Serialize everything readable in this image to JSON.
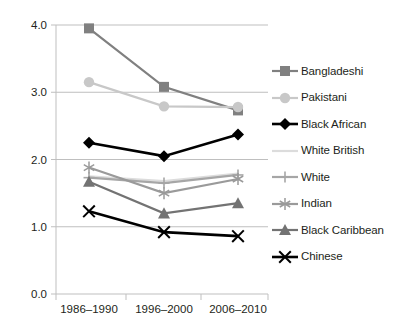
{
  "chart_data": {
    "type": "line",
    "title": "",
    "subtitle": "",
    "xlabel": "",
    "ylabel": "",
    "categories": [
      "1986–1990",
      "1996–2000",
      "2006–2010"
    ],
    "ylim": [
      0.0,
      4.0
    ],
    "ytick_labels": [
      "0.0",
      "1.0",
      "2.0",
      "3.0",
      "4.0"
    ],
    "ytick_values": [
      0.0,
      1.0,
      2.0,
      3.0,
      4.0
    ],
    "grid": true,
    "legend_position": "right",
    "series": [
      {
        "name": "Bangladeshi",
        "values": [
          3.95,
          3.08,
          2.73
        ],
        "color": "#808080",
        "marker": "square"
      },
      {
        "name": "Pakistani",
        "values": [
          3.15,
          2.79,
          2.78
        ],
        "color": "#c8c8c8",
        "marker": "circle"
      },
      {
        "name": "Black African",
        "values": [
          2.25,
          2.05,
          2.37
        ],
        "color": "#000000",
        "marker": "diamond"
      },
      {
        "name": "White British",
        "values": [
          1.75,
          1.68,
          1.79
        ],
        "color": "#dcdcdc",
        "marker": "none"
      },
      {
        "name": "White",
        "values": [
          1.73,
          1.65,
          1.77
        ],
        "color": "#a6a6a6",
        "marker": "plus"
      },
      {
        "name": "Indian",
        "values": [
          1.88,
          1.5,
          1.71
        ],
        "color": "#9a9a9a",
        "marker": "asterisk"
      },
      {
        "name": "Black Caribbean",
        "values": [
          1.67,
          1.2,
          1.35
        ],
        "color": "#737373",
        "marker": "triangle"
      },
      {
        "name": "Chinese",
        "values": [
          1.23,
          0.92,
          0.86
        ],
        "color": "#000000",
        "marker": "cross"
      }
    ]
  }
}
